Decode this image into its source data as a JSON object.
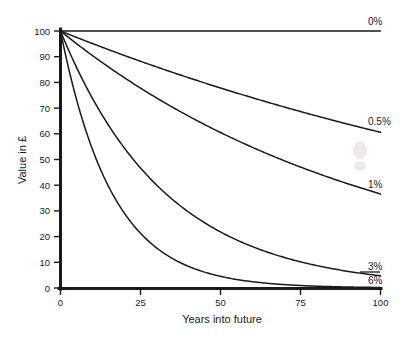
{
  "chart_data": {
    "type": "line",
    "title": "",
    "xlabel": "Years into future",
    "ylabel": "Value in £",
    "xlim": [
      0,
      100
    ],
    "ylim": [
      0,
      100
    ],
    "xticks": [
      0,
      25,
      50,
      75,
      100
    ],
    "xtick_labels": [
      "0",
      "25",
      "50",
      "75",
      "100"
    ],
    "yticks": [
      0,
      10,
      20,
      30,
      40,
      50,
      60,
      70,
      80,
      90,
      100
    ],
    "ytick_labels": [
      "0",
      "10",
      "20",
      "30",
      "40",
      "50",
      "60",
      "70",
      "80",
      "90",
      "100"
    ],
    "grid": false,
    "legend_position": "right-of-curve-ends",
    "x": [
      0,
      5,
      10,
      15,
      20,
      25,
      30,
      35,
      40,
      45,
      50,
      55,
      60,
      65,
      70,
      75,
      80,
      85,
      90,
      95,
      100
    ],
    "series": [
      {
        "name": "0%",
        "label": "0%",
        "rate": 0.0,
        "color": "#1a1a1a",
        "values": [
          100,
          100,
          100,
          100,
          100,
          100,
          100,
          100,
          100,
          100,
          100,
          100,
          100,
          100,
          100,
          100,
          100,
          100,
          100,
          100,
          100
        ]
      },
      {
        "name": "0.5%",
        "label": "0.5%",
        "rate": 0.005,
        "color": "#1a1a1a",
        "values": [
          100,
          97.5,
          95.1,
          92.8,
          90.5,
          88.2,
          86.0,
          83.9,
          81.8,
          79.8,
          77.8,
          75.9,
          74.0,
          72.2,
          70.4,
          68.6,
          66.9,
          65.3,
          63.7,
          62.1,
          60.6
        ]
      },
      {
        "name": "1%",
        "label": "1%",
        "rate": 0.01,
        "color": "#1a1a1a",
        "values": [
          100,
          95.1,
          90.4,
          86.0,
          81.8,
          77.8,
          74.0,
          70.3,
          66.9,
          63.6,
          60.5,
          57.5,
          54.7,
          52.0,
          49.5,
          47.0,
          44.7,
          42.5,
          40.5,
          38.5,
          36.6
        ]
      },
      {
        "name": "3%",
        "label": "3%",
        "rate": 0.03,
        "color": "#1a1a1a",
        "values": [
          100,
          85.9,
          73.7,
          63.3,
          54.4,
          46.7,
          40.1,
          34.4,
          29.6,
          25.4,
          21.8,
          18.7,
          16.1,
          13.8,
          11.9,
          10.2,
          8.8,
          7.5,
          6.5,
          5.5,
          4.8
        ]
      },
      {
        "name": "6%",
        "label": "6%",
        "rate": 0.06,
        "color": "#1a1a1a",
        "values": [
          100,
          73.4,
          53.9,
          39.5,
          29.0,
          21.3,
          15.6,
          11.5,
          8.4,
          6.2,
          4.5,
          3.3,
          2.4,
          1.8,
          1.3,
          1.0,
          0.7,
          0.5,
          0.4,
          0.3,
          0.2
        ]
      }
    ],
    "series_labels": [
      {
        "label": "0%",
        "x_px": 368,
        "y_px": 25
      },
      {
        "label": "0.5%",
        "x_px": 368,
        "y_px": 125
      },
      {
        "label": "1%",
        "x_px": 368,
        "y_px": 188
      },
      {
        "label": "3%",
        "x_px": 368,
        "y_px": 270
      },
      {
        "label": "6%",
        "x_px": 368,
        "y_px": 284
      }
    ]
  },
  "axes": {
    "x_title": "Years into future",
    "y_title": "Value in £"
  }
}
